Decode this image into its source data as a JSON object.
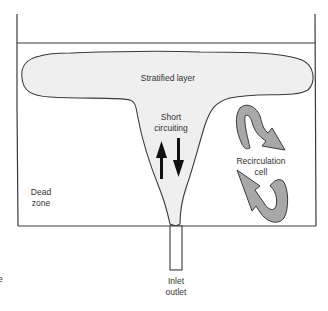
{
  "diagram": {
    "type": "tank-flow-schematic",
    "labels": {
      "stratified_layer": "Stratified layer",
      "short_circuiting_line1": "Short",
      "short_circuiting_line2": "circuiting",
      "recirculation_line1": "Recirculation",
      "recirculation_line2": "cell",
      "dead_zone_line1": "Dead",
      "dead_zone_line2": "zone",
      "inlet_line1": "Inlet",
      "inlet_line2": "outlet",
      "edge_fragment": "e"
    },
    "colors": {
      "outline": "#3a3a3a",
      "stratified_fill": "#efefef",
      "recirculation_arrow_fill": "#a8a8a8",
      "short_circuit_arrow": "#111111",
      "text": "#333333"
    }
  }
}
